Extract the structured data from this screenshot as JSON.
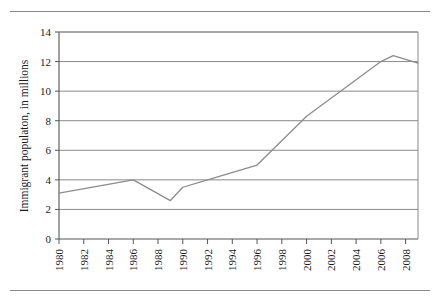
{
  "figure": {
    "name": "immigrant-population-line-chart",
    "rules": {
      "top_rule": "horizontal-rule",
      "bottom_rule": "horizontal-rule"
    }
  },
  "chart_data": {
    "type": "line",
    "title": "",
    "subtitle": "",
    "xlabel": "",
    "ylabel": "Immigrant populaton, in millions",
    "xlim": [
      1980,
      2009
    ],
    "ylim": [
      0,
      14
    ],
    "grid": true,
    "grid_axis": "y",
    "legend": false,
    "legend_position": "none",
    "x_tick_labels": [
      "1980",
      "1982",
      "1984",
      "1986",
      "1988",
      "1990",
      "1992",
      "1994",
      "1996",
      "1998",
      "2000",
      "2002",
      "2004",
      "2006",
      "2008"
    ],
    "x_ticks": [
      1980,
      1982,
      1984,
      1986,
      1988,
      1990,
      1992,
      1994,
      1996,
      1998,
      2000,
      2002,
      2004,
      2006,
      2008
    ],
    "y_tick_labels": [
      "0",
      "2",
      "4",
      "6",
      "8",
      "10",
      "12",
      "14"
    ],
    "y_ticks": [
      0,
      2,
      4,
      6,
      8,
      10,
      12,
      14
    ],
    "series": [
      {
        "name": "Immigrant population",
        "color": "#8c8c8c",
        "x": [
          1980,
          1986,
          1989,
          1990,
          1992,
          1996,
          2000,
          2006,
          2007,
          2009
        ],
        "values": [
          3.1,
          4.0,
          2.6,
          3.5,
          4.0,
          5.0,
          8.3,
          12.0,
          12.4,
          11.9
        ]
      }
    ],
    "colors": {
      "line": "#8c8c8c",
      "grid": "#8a8a8a",
      "axis": "#555555",
      "text": "#1a1a1a",
      "background": "#ffffff"
    }
  }
}
